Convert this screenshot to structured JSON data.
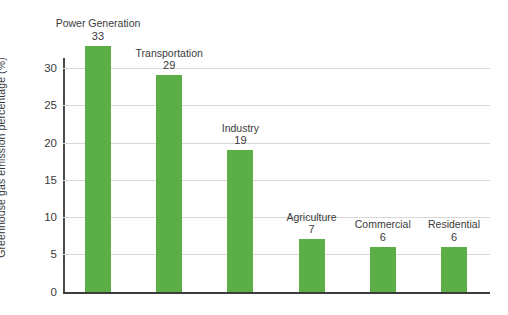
{
  "chart_data": {
    "type": "bar",
    "title": "",
    "xlabel": "",
    "ylabel": "Greenhouse gas emission percentage (%)",
    "ylim": [
      0,
      30
    ],
    "grid": true,
    "legend": "none",
    "orientation": "vertical",
    "bar_color": "#5cae47",
    "categories": [
      "Power Generation",
      "Transportation",
      "Industry",
      "Agriculture",
      "Commercial",
      "Residential"
    ],
    "values": [
      33,
      29,
      19,
      7,
      6,
      6
    ],
    "value_labels": [
      "33",
      "29",
      "19",
      "7",
      "6",
      "6"
    ],
    "y_ticks": [
      0,
      5,
      10,
      15,
      20,
      25,
      30
    ],
    "y_tick_labels": [
      "0",
      "5",
      "10",
      "15",
      "20",
      "25",
      "30"
    ],
    "x_tick_labels": []
  },
  "axis": {
    "y_title": "Greenhouse gas emission percentage (%)"
  }
}
